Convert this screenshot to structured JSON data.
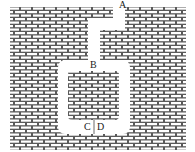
{
  "diagram": {
    "title": "",
    "labels": {
      "a": "A",
      "b": "B",
      "c": "C",
      "d": "D"
    },
    "colors": {
      "mortar": "#555555",
      "brick": "#ffffff",
      "channel": "#ffffff",
      "label": "#222222"
    }
  }
}
